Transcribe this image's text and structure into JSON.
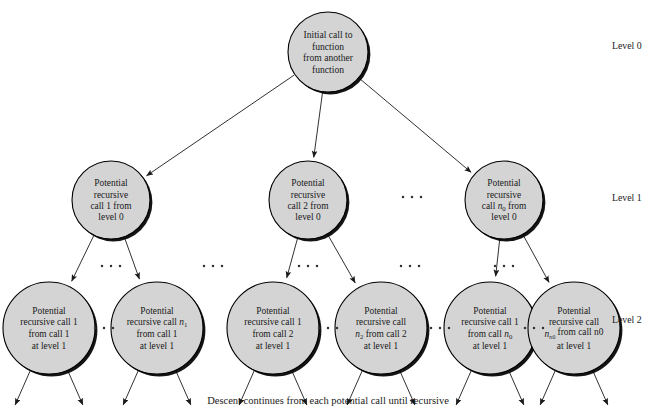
{
  "figure": {
    "caption": "Descent continues from each potential call until recursive",
    "colors": {
      "node_fill": "#d4d4d4",
      "node_stroke": "#000000",
      "shadow": "#000000",
      "text": "#1a1a1a",
      "background": "#ffffff",
      "arrow": "#1a1a1a"
    }
  },
  "level_labels": [
    {
      "text": "Level 0",
      "x": 612,
      "y": 49
    },
    {
      "text": "Level 1",
      "x": 612,
      "y": 201
    },
    {
      "text": "Level 2",
      "x": 612,
      "y": 323
    }
  ],
  "root": {
    "cx": 328,
    "cy": 52,
    "r": 40,
    "lines": [
      "Initial call to",
      "function",
      "from another",
      "function"
    ]
  },
  "level1": [
    {
      "cx": 111,
      "cy": 200,
      "r": 39,
      "lines": [
        "Potential",
        "recursive",
        "call 1 from",
        "level 0"
      ]
    },
    {
      "cx": 308,
      "cy": 200,
      "r": 39,
      "lines": [
        "Potential",
        "recursive",
        "call 2 from",
        "level 0"
      ]
    },
    {
      "cx": 504,
      "cy": 200,
      "r": 39,
      "lines": [
        "Potential",
        "recursive",
        "call n0 from",
        "level 0"
      ],
      "sub_line": 2,
      "sub_var": "n",
      "sub_idx": "0"
    }
  ],
  "level2": [
    {
      "cx": 49,
      "cy": 328,
      "r": 46,
      "lines": [
        "Potential",
        "recursive call 1",
        "from call 1",
        "at level 1"
      ]
    },
    {
      "cx": 157,
      "cy": 328,
      "r": 46,
      "lines": [
        "Potential",
        "recursive call n1",
        "from call 1",
        "at level 1"
      ],
      "sub_line": 1,
      "sub_var": "n",
      "sub_idx": "1"
    },
    {
      "cx": 273,
      "cy": 328,
      "r": 46,
      "lines": [
        "Potential",
        "recursive call 1",
        "from call 2",
        "at level 1"
      ]
    },
    {
      "cx": 381,
      "cy": 328,
      "r": 46,
      "lines": [
        "Potential",
        "recursive call",
        "n2 from call 2",
        "at level 1"
      ],
      "sub_line": 2,
      "sub_var": "n",
      "sub_idx": "2"
    },
    {
      "cx": 490,
      "cy": 328,
      "r": 46,
      "lines": [
        "Potential",
        "recursive call 1",
        "from call n0",
        "at level 1"
      ],
      "sub_line": 2,
      "sub_var": "n",
      "sub_idx": "0"
    },
    {
      "cx": 574,
      "cy": 328,
      "r": 46,
      "lines": [
        "Potential",
        "recursive call",
        "nn0 from call n0",
        "at level 1"
      ],
      "sub_line": 2,
      "sub_var": "n",
      "sub_idx": "n0"
    }
  ],
  "ellipses": [
    {
      "name": "between-level1-nodes",
      "x": 412,
      "y": 197
    },
    {
      "name": "above-level2-group-1",
      "x": 111,
      "y": 266
    },
    {
      "name": "above-level2-group-2",
      "x": 308,
      "y": 266
    },
    {
      "name": "above-level2-group-3",
      "x": 504,
      "y": 266
    },
    {
      "name": "between-level2-groups-1",
      "x": 213,
      "y": 266
    },
    {
      "name": "between-level2-groups-2",
      "x": 410,
      "y": 266
    },
    {
      "name": "between-level2-nodes-1",
      "x": 104,
      "y": 328
    },
    {
      "name": "between-level2-nodes-2",
      "x": 328,
      "y": 328
    },
    {
      "name": "between-level2-nodes-3",
      "x": 440,
      "y": 328
    },
    {
      "name": "between-level2-nodes-4",
      "x": 534,
      "y": 328
    }
  ]
}
